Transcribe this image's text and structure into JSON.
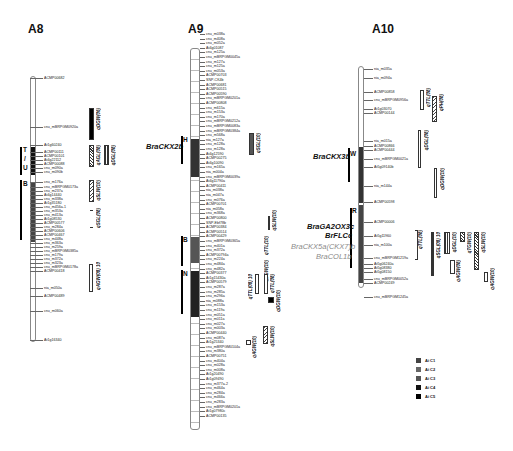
{
  "chromosomes": {
    "A8": {
      "title": "A8",
      "markers": [
        "ACMP00682",
        "cnu_mBRPGM0920a",
        "At1g60240",
        "ACMP00111",
        "ACMP00101",
        "At4g22112",
        "ACMP00088",
        "cnu_m090a",
        "cnu_m090b",
        "cnu_m176a",
        "cnu_mBRPGM0173a",
        "cnu_m237a",
        "At4g14440",
        "cnu_m338a",
        "At1g35180",
        "cnu_m456a-1",
        "cnu_m353a",
        "cnu_m413a",
        "At1g08530",
        "ACMP00577",
        "cnu_m284a",
        "ACMP00606",
        "ACMP00467",
        "cnu_m448a",
        "cnu_m363a",
        "cnu_m259a",
        "cnu_mBRPGM0385a",
        "cnu_m179a",
        "cnu_m372a",
        "cnu_m323a",
        "cnu_mBRPGM0178a",
        "ACMP00418",
        "nia_m050a",
        "ACMP00489",
        "cnu_m060a",
        "At1g16340"
      ],
      "regions": [
        {
          "label": "T"
        },
        {
          "label": "/"
        },
        {
          "label": "U"
        },
        {
          "label": "B"
        }
      ],
      "qtls": [
        "qDGW(06)",
        "qAGL(08)",
        "qDGL(08)",
        "qSLW(10)",
        "qSGL(08)",
        "qAGW(08) 10"
      ]
    },
    "A9": {
      "title": "A9",
      "markers": [
        "cnu_m038a",
        "cnu_m408a",
        "cnu_m052a",
        "At4g01087",
        "cnu_m125a",
        "cnu_mBRPGM0045a",
        "cnu_m127a",
        "cnu_m125a",
        "cnu_m053a",
        "ACMP00703",
        "SNP-CK4b",
        "ACMP00681",
        "ACMP00515",
        "ACMP00590",
        "cnu_mBRPGM0201a",
        "ACMP00808",
        "cnu_m615a",
        "cnu_m153a",
        "cnu_m170a",
        "cnu_mBRPGM0212a",
        "cnu_mBRPGM0083a",
        "cnu_mBRPGM0384a",
        "cnu_m568a",
        "nia_m127a",
        "cnu_m128a",
        "cnu_m128a",
        "At4g12590",
        "ACMP00275",
        "At4g10090",
        "cnu_m165a",
        "nia_m004a",
        "cnu_mBRPGM0039a",
        "At4g11790a",
        "ACMP00411",
        "nia_m038a",
        "nia_m047a",
        "cnu_m076a",
        "ACMP00701",
        "nia_m058a",
        "cnu_m368a",
        "ACMP00800",
        "SNP-Ebf78b",
        "ACMP00384",
        "ACMP00514",
        "ACMP00429",
        "cnu_mBRPGM0365a",
        "cnu_m401a",
        "cnu_m372a",
        "ACMP00794a",
        "cnu_m224a",
        "cnu_m484a",
        "cnu_m482a",
        "ACMP00377",
        "At1g15430a",
        "ACMP00579",
        "cnu_m287a",
        "cnu_m285a",
        "cnu_m296a",
        "nia_m088a",
        "cnu_m153a",
        "cnu_m119a",
        "cnu_m051a",
        "cnu_m011a",
        "cnu_m027a",
        "cnu_m003a",
        "ACMP00440",
        "cnu_m087a",
        "At1g25340",
        "cnu_mBRPGM0104a",
        "cnu_m380a",
        "ACMP00751",
        "cnu_m404a",
        "cnu_m028a",
        "cnu_m008a",
        "At1g20490",
        "At1g09490",
        "cnu_m377a-2",
        "cnu_m464a",
        "cnu_m284a",
        "cnu_m466a",
        "cnu_m283a",
        "cnu_mBRPGM0201a",
        "At1g07980c",
        "ACMP00135"
      ],
      "regions": [
        {
          "label": "H",
          "gene": "BraCKX2b"
        },
        {
          "label": "B"
        },
        {
          "label": "N"
        }
      ],
      "qtls": [
        "qSGL(10)",
        "qSLW(10)",
        "qTTL(10)",
        "qDGW(10)",
        "qTTL(08) 10",
        "qTTL(08)",
        "qDGW(10)",
        "qSLW(10)",
        "qAGW(10)"
      ]
    },
    "A10": {
      "title": "A10",
      "markers": [
        "nia_m035a",
        "nia_m094a",
        "ACMP00858",
        "cnu_mBRPGM0956a",
        "At1g03070",
        "ACMP00144",
        "nia_m015a",
        "ACMP00866",
        "ACMP00444",
        "cnu_mBRPGM0021a",
        "At5g09140b",
        "nia_m144a",
        "ACMP00598",
        "ACMP00006",
        "At5g11960",
        "nia_m100a",
        "cnu_mBRPGM1219a",
        "At5g06240a",
        "At5g08380",
        "At5g08150",
        "cnu_mBRPGM0052a",
        "ACMP00249",
        "cnu_mBRPGM1245a"
      ],
      "regions": [
        {
          "label": "W",
          "gene": "BraCKX3b"
        },
        {
          "label": "R"
        }
      ],
      "genes_r": [
        {
          "name": "BraGA2OX3c",
          "grey": false
        },
        {
          "name": "BrFLCc",
          "grey": false
        },
        {
          "name": "BraCKX5a(CKX7)b",
          "grey": true
        },
        {
          "name": "BraCOL1b",
          "grey": true
        }
      ],
      "qtls": [
        "qTTL(08)",
        "qPH(08)",
        "qDGL(08)",
        "qDGW(10)",
        "qTTL(08)",
        "qSGL(08) 10",
        "qDGL(10)",
        "qTGW(10)",
        "qSLW(10)",
        "qAGW(08)",
        "qAGW(10)",
        "qAGW(10)"
      ]
    }
  },
  "legend": [
    {
      "label": "Ai C1",
      "color": "#444444"
    },
    {
      "label": "Ai C2",
      "color": "#666666"
    },
    {
      "label": "Ai C3",
      "color": "#555555"
    },
    {
      "label": "Ai C4",
      "color": "#111111"
    },
    {
      "label": "Ai C5",
      "color": "#000000"
    }
  ]
}
